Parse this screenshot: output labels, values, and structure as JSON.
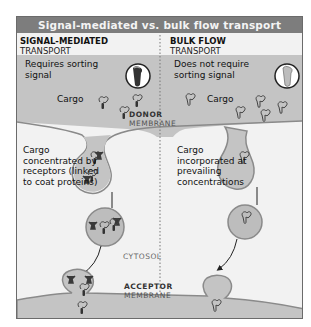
{
  "title": "Signal-mediated vs. bulk flow transport",
  "left_panel": {
    "heading_bold": "SIGNAL-MEDIATED",
    "heading_normal": "TRANSPORT",
    "signal_label": "Requires sorting signal",
    "cargo_label": "Cargo",
    "vesicle_label": "Cargo concentrated by receptors (linked to coat proteins)"
  },
  "right_panel": {
    "heading_bold": "BULK FLOW",
    "heading_normal": "TRANSPORT",
    "signal_label": "Does not require sorting signal",
    "cargo_label": "Cargo",
    "vesicle_label": "Cargo incorporated at prevailing concentrations"
  },
  "center_labels": {
    "donor_bold": "DONOR",
    "donor_normal": "MEMBRANE",
    "cytosol": "CYTOSOL",
    "acceptor_bold": "ACCEPTOR",
    "acceptor_normal": "MEMBRANE"
  },
  "colors": {
    "title_bar": "#7d7d7d",
    "membrane_fill": "#c4c4c4",
    "membrane_stroke": "#8a8a8a",
    "vesicle_fill": "#bdbdbd",
    "background": "#f2f2f2",
    "receptor": "#3a3a3a"
  }
}
